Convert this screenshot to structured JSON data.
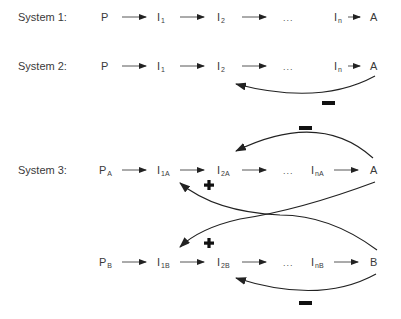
{
  "diagram": {
    "rows": [
      {
        "label": "System 1:",
        "nodes": [
          {
            "base": "P",
            "sub": ""
          },
          {
            "base": "I",
            "sub": "1"
          },
          {
            "base": "I",
            "sub": "2"
          },
          {
            "base": "...",
            "sub": ""
          },
          {
            "base": "I",
            "sub": "n"
          },
          {
            "base": "A",
            "sub": ""
          }
        ]
      },
      {
        "label": "System 2:",
        "nodes": [
          {
            "base": "P",
            "sub": ""
          },
          {
            "base": "I",
            "sub": "1"
          },
          {
            "base": "I",
            "sub": "2"
          },
          {
            "base": "...",
            "sub": ""
          },
          {
            "base": "I",
            "sub": "n"
          },
          {
            "base": "A",
            "sub": ""
          }
        ],
        "feedback": {
          "from": "A",
          "to": "I2",
          "sign": "−"
        }
      },
      {
        "label": "System 3:",
        "nodes": [
          {
            "base": "P",
            "sub": "A"
          },
          {
            "base": "I",
            "sub": "1A"
          },
          {
            "base": "I",
            "sub": "2A"
          },
          {
            "base": "...",
            "sub": ""
          },
          {
            "base": "I",
            "sub": "nA"
          },
          {
            "base": "A",
            "sub": ""
          }
        ],
        "feedback": {
          "from": "A",
          "to": "I2A",
          "sign": "−"
        }
      },
      {
        "label": "",
        "nodes": [
          {
            "base": "P",
            "sub": "B"
          },
          {
            "base": "I",
            "sub": "1B"
          },
          {
            "base": "I",
            "sub": "2B"
          },
          {
            "base": "...",
            "sub": ""
          },
          {
            "base": "I",
            "sub": "nB"
          },
          {
            "base": "B",
            "sub": ""
          }
        ],
        "feedback": {
          "from": "B",
          "to": "I2B",
          "sign": "−"
        }
      }
    ],
    "cross_links": [
      {
        "from": "A",
        "to": "I1B",
        "sign": "+"
      },
      {
        "from": "B",
        "to": "I1A",
        "sign": "+"
      }
    ],
    "colors": {
      "text": "#3a3a3a",
      "line": "#222222"
    }
  }
}
